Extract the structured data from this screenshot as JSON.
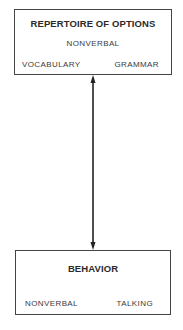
{
  "top_box": {
    "title": "REPERTOIRE OF OPTIONS",
    "center_item": "NONVERBAL",
    "left_item": "VOCABULARY",
    "right_item": "GRAMMAR"
  },
  "bottom_box": {
    "title": "BEHAVIOR",
    "left_item": "NONVERBAL",
    "right_item": "TALKING"
  },
  "connector": {
    "type": "bidirectional-arrow",
    "from": "REPERTOIRE OF OPTIONS",
    "to": "BEHAVIOR"
  }
}
